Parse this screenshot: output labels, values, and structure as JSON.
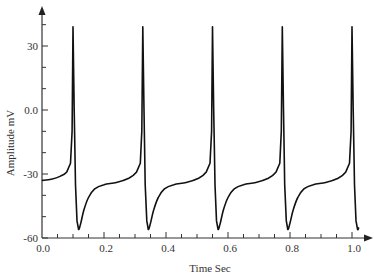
{
  "chart_data": {
    "type": "line",
    "title": "",
    "xlabel": "Time Sec",
    "ylabel": "Amplitude mV",
    "xlim": [
      0.0,
      1.03
    ],
    "ylim": [
      -60,
      45
    ],
    "x_ticks": [
      0.0,
      0.2,
      0.4,
      0.6,
      0.8,
      1.0
    ],
    "x_tick_labels": [
      "0.0",
      "0.2",
      "0.4",
      "0.6",
      "0.8",
      "1.0"
    ],
    "x_minor_step": 0.05,
    "y_ticks": [
      -60,
      -30,
      0,
      30
    ],
    "y_tick_labels": [
      "-60",
      "-30",
      "0.0",
      "30"
    ],
    "y_minor_step": 10,
    "grid": false,
    "legend": null,
    "series": [
      {
        "name": "action potential",
        "color": "#111111",
        "x": [
          0.0,
          0.03,
          0.06,
          0.08,
          0.092,
          0.097,
          0.1,
          0.104,
          0.108,
          0.113,
          0.118,
          0.125,
          0.135,
          0.15,
          0.17,
          0.2,
          0.24,
          0.28,
          0.305,
          0.317,
          0.322,
          0.325,
          0.329,
          0.333,
          0.338,
          0.343,
          0.35,
          0.36,
          0.375,
          0.395,
          0.425,
          0.465,
          0.505,
          0.53,
          0.542,
          0.547,
          0.55,
          0.554,
          0.558,
          0.563,
          0.568,
          0.575,
          0.585,
          0.6,
          0.62,
          0.65,
          0.69,
          0.73,
          0.755,
          0.767,
          0.772,
          0.775,
          0.779,
          0.783,
          0.788,
          0.793,
          0.8,
          0.81,
          0.825,
          0.845,
          0.875,
          0.915,
          0.955,
          0.98,
          0.992,
          0.997,
          1.0,
          1.004,
          1.008,
          1.013,
          1.018,
          1.022
        ],
        "y": [
          -33,
          -32.5,
          -31,
          -29,
          -25,
          -10,
          39,
          0,
          -35,
          -52,
          -56,
          -53,
          -47,
          -41,
          -37,
          -35,
          -34,
          -32,
          -29,
          -25,
          -10,
          39,
          0,
          -35,
          -52,
          -56,
          -53,
          -47,
          -41,
          -37,
          -35,
          -34,
          -32,
          -29,
          -25,
          -10,
          39,
          0,
          -35,
          -52,
          -56,
          -53,
          -47,
          -41,
          -37,
          -35,
          -34,
          -32,
          -29,
          -25,
          -10,
          39,
          0,
          -35,
          -52,
          -56,
          -53,
          -47,
          -41,
          -37,
          -35,
          -34,
          -32,
          -29,
          -25,
          -10,
          39,
          0,
          -35,
          -52,
          -56,
          -55
        ]
      }
    ]
  },
  "axes": {
    "x_title": "Time Sec",
    "y_title": "Amplitude mV"
  }
}
